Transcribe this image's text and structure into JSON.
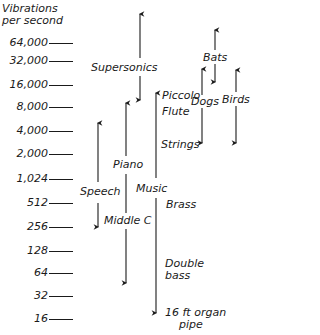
{
  "axis": {
    "title_line1": "Vibrations",
    "title_line2": "per second",
    "ticks": [
      {
        "label": "64,000",
        "y": 43
      },
      {
        "label": "32,000",
        "y": 61
      },
      {
        "label": "16,000",
        "y": 85
      },
      {
        "label": "8,000",
        "y": 107
      },
      {
        "label": "4,000",
        "y": 131
      },
      {
        "label": "2,000",
        "y": 154
      },
      {
        "label": "1,024",
        "y": 179
      },
      {
        "label": "512",
        "y": 203
      },
      {
        "label": "256",
        "y": 227
      },
      {
        "label": "128",
        "y": 251
      },
      {
        "label": "64",
        "y": 273
      },
      {
        "label": "32",
        "y": 296
      },
      {
        "label": "16",
        "y": 319
      }
    ]
  },
  "ranges": {
    "supersonics": "Supersonics",
    "bats": "Bats",
    "dogs": "Dogs",
    "birds": "Birds",
    "speech": "Speech",
    "piano": "Piano",
    "middle_c": "Middle C",
    "music": "Music",
    "piccolo": "Piccolo",
    "flute": "Flute",
    "strings": "Strings",
    "brass": "Brass",
    "double_bass_1": "Double",
    "double_bass_2": "bass",
    "organ_1": "16 ft organ",
    "organ_2": "pipe"
  },
  "colors": {
    "ink": "#1a1a1a",
    "background": "#ffffff"
  }
}
